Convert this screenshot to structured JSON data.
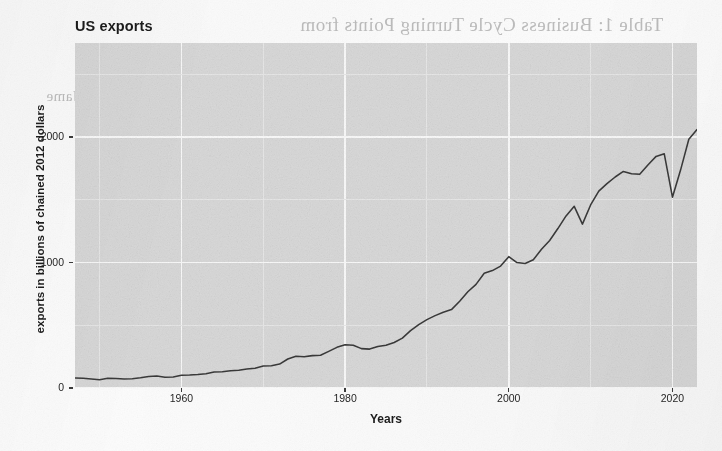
{
  "chart_data": {
    "type": "line",
    "title": "US exports",
    "xlabel": "Years",
    "ylabel": "exports in billions of chained 2012 dollars",
    "xlim": [
      1947,
      2023
    ],
    "ylim": [
      0,
      2750
    ],
    "x_ticks": [
      1960,
      1980,
      2000,
      2020
    ],
    "y_ticks": [
      0,
      1000,
      2000
    ],
    "grid": "major-and-minor",
    "legend": "none",
    "line_color": "#3a3a3a",
    "series": [
      {
        "name": "US exports",
        "x": [
          1947,
          1948,
          1949,
          1950,
          1951,
          1952,
          1953,
          1954,
          1955,
          1956,
          1957,
          1958,
          1959,
          1960,
          1961,
          1962,
          1963,
          1964,
          1965,
          1966,
          1967,
          1968,
          1969,
          1970,
          1971,
          1972,
          1973,
          1974,
          1975,
          1976,
          1977,
          1978,
          1979,
          1980,
          1981,
          1982,
          1983,
          1984,
          1985,
          1986,
          1987,
          1988,
          1989,
          1990,
          1991,
          1992,
          1993,
          1994,
          1995,
          1996,
          1997,
          1998,
          1999,
          2000,
          2001,
          2002,
          2003,
          2004,
          2005,
          2006,
          2007,
          2008,
          2009,
          2010,
          2011,
          2012,
          2013,
          2014,
          2015,
          2016,
          2017,
          2018,
          2019,
          2020,
          2021,
          2022,
          2023
        ],
        "y": [
          79,
          78,
          72,
          66,
          77,
          75,
          72,
          74,
          81,
          92,
          96,
          86,
          88,
          101,
          103,
          107,
          114,
          128,
          130,
          138,
          142,
          151,
          158,
          176,
          178,
          191,
          231,
          253,
          249,
          258,
          261,
          292,
          324,
          345,
          341,
          314,
          310,
          330,
          340,
          363,
          398,
          457,
          505,
          545,
          577,
          604,
          625,
          691,
          767,
          826,
          914,
          936,
          972,
          1047,
          1000,
          993,
          1022,
          1106,
          1176,
          1271,
          1372,
          1448,
          1306,
          1459,
          1569,
          1629,
          1682,
          1726,
          1707,
          1703,
          1778,
          1846,
          1867,
          1521,
          1739,
          1983,
          2060
        ],
        "y_display_scale": "values plotted in billions of chained 2012 dollars"
      }
    ],
    "annotations": [
      {
        "label": "1982 recession plateau",
        "x": 1982
      },
      {
        "label": "2001 dot-com dip",
        "x": 2001
      },
      {
        "label": "2009 great-recession trough",
        "x": 2009
      },
      {
        "label": "2020 COVID-19 collapse",
        "x": 2020
      }
    ]
  },
  "plot": {
    "title": "US exports",
    "x_axis_title": "Years",
    "y_axis_title": "exports in billions of chained 2012 dollars",
    "x_tick_labels": [
      "1960",
      "1980",
      "2000",
      "2020"
    ],
    "y_tick_labels": [
      "2000",
      "1000",
      "0"
    ],
    "panel_fill": "#d9d9d9",
    "gridline_major_color": "#fafafa",
    "gridline_minor_color": "#e8e8e8",
    "line_color": "#3a3a3a"
  },
  "page_bleedthrough": {
    "note": "mirrored text bleeding through from the reverse side of the scanned page",
    "lines": [
      {
        "text": "Table 1:  Business Cycle Turning Points from",
        "x": 300,
        "y": 14,
        "size": 19,
        "dark": true
      },
      {
        "text": "Trough Date",
        "x": 282,
        "y": 88,
        "size": 15,
        "dark": true
      },
      {
        "text": "Peak Date",
        "x": 140,
        "y": 88,
        "size": 15,
        "dark": true
      },
      {
        "text": "Name",
        "x": 46,
        "y": 88,
        "size": 15,
        "dark": true
      },
      {
        "text": "1949Q4",
        "x": 620,
        "y": 89,
        "size": 15,
        "dark": false
      },
      {
        "text": "1948Q4  -  1949Q4",
        "x": 268,
        "y": 130,
        "size": 15,
        "dark": true
      },
      {
        "text": "1949",
        "x": 628,
        "y": 131,
        "size": 15,
        "dark": false
      },
      {
        "text": "1953Q2   1954Q2",
        "x": 268,
        "y": 171,
        "size": 15,
        "dark": true
      },
      {
        "text": "1953",
        "x": 628,
        "y": 172,
        "size": 15,
        "dark": false
      },
      {
        "text": "1957Q3   1958Q2",
        "x": 268,
        "y": 212,
        "size": 15,
        "dark": true
      },
      {
        "text": "1957",
        "x": 628,
        "y": 213,
        "size": 15,
        "dark": false
      },
      {
        "text": "1960Q2   1961Q1",
        "x": 268,
        "y": 253,
        "size": 15,
        "dark": true
      },
      {
        "text": "1960",
        "x": 628,
        "y": 254,
        "size": 15,
        "dark": false
      },
      {
        "text": "1969Q4   1970Q4",
        "x": 268,
        "y": 294,
        "size": 15,
        "dark": true
      },
      {
        "text": "1969",
        "x": 628,
        "y": 295,
        "size": 15,
        "dark": false
      },
      {
        "text": "1973Q4   1975Q1",
        "x": 268,
        "y": 332,
        "size": 15,
        "dark": true
      },
      {
        "text": "1973",
        "x": 628,
        "y": 333,
        "size": 15,
        "dark": false
      },
      {
        "text": "1980Q1   1980Q3",
        "x": 268,
        "y": 366,
        "size": 15,
        "dark": true
      },
      {
        "text": "1980",
        "x": 628,
        "y": 367,
        "size": 15,
        "dark": false
      },
      {
        "text": "The Event",
        "x": 152,
        "y": 107,
        "size": 14,
        "dark": false
      }
    ]
  }
}
